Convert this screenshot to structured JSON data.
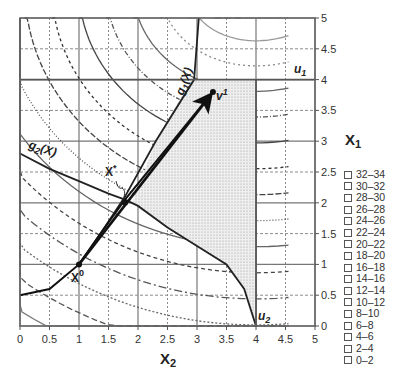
{
  "chart_data": {
    "type": "line",
    "title": "",
    "xlabel": "X2",
    "ylabel": "X1",
    "xlim": [
      0,
      5
    ],
    "ylim": [
      0,
      5
    ],
    "x_ticks": [
      "0",
      "0.5",
      "1",
      "1.5",
      "2",
      "2.5",
      "3",
      "3.5",
      "4",
      "4.5",
      "5"
    ],
    "y_ticks": [
      "0",
      "0.5",
      "1",
      "1.5",
      "2",
      "2.5",
      "3",
      "3.5",
      "4",
      "4.5",
      "5"
    ],
    "grid": true,
    "legend_position": "right",
    "legend_title": "X1",
    "legend": [
      "32–34",
      "30–32",
      "28–30",
      "26–28",
      "24–26",
      "22–24",
      "20–22",
      "18–20",
      "16–18",
      "14–16",
      "12–14",
      "10–12",
      "8–10",
      "6–8",
      "4–6",
      "2–4",
      "0–2"
    ],
    "constraints": [
      {
        "name": "g1(X)",
        "points": [
          [
            1.0,
            1.0
          ],
          [
            1.4,
            1.55
          ],
          [
            1.78,
            2.1
          ],
          [
            2.3,
            3.0
          ],
          [
            2.95,
            4.0
          ],
          [
            3.03,
            5.0
          ]
        ]
      },
      {
        "name": "g2(X)",
        "points": [
          [
            0.0,
            2.8
          ],
          [
            0.5,
            2.55
          ],
          [
            1.0,
            2.35
          ],
          [
            1.5,
            2.15
          ],
          [
            1.78,
            2.05
          ],
          [
            2.0,
            1.95
          ],
          [
            2.5,
            1.6
          ],
          [
            3.0,
            1.3
          ],
          [
            3.5,
            1.0
          ],
          [
            3.8,
            0.6
          ],
          [
            3.9,
            0.3
          ],
          [
            4.0,
            0.0
          ]
        ]
      },
      {
        "name": "u1",
        "points": [
          [
            0.0,
            4.0
          ],
          [
            5.0,
            4.0
          ]
        ]
      },
      {
        "name": "u2",
        "points": [
          [
            4.0,
            0.0
          ],
          [
            4.0,
            4.0
          ]
        ]
      }
    ],
    "feasible_region": [
      [
        2.9,
        4.0
      ],
      [
        4.0,
        4.0
      ],
      [
        4.0,
        0.0
      ],
      [
        3.9,
        0.3
      ],
      [
        3.8,
        0.6
      ],
      [
        3.5,
        1.0
      ],
      [
        3.0,
        1.3
      ],
      [
        2.5,
        1.6
      ],
      [
        2.0,
        1.95
      ],
      [
        1.9,
        2.0
      ],
      [
        2.3,
        3.0
      ]
    ],
    "points": [
      {
        "name": "X0",
        "x2": 1.0,
        "x1": 1.0
      },
      {
        "name": "X*",
        "x2": 1.78,
        "x1": 2.0
      },
      {
        "name": "v1",
        "x2": 3.27,
        "x1": 3.8
      }
    ],
    "search_path": [
      [
        0.0,
        0.5
      ],
      [
        0.5,
        0.6
      ],
      [
        1.0,
        1.0
      ],
      [
        1.4,
        1.55
      ],
      [
        1.78,
        2.05
      ],
      [
        3.27,
        3.8
      ]
    ],
    "arrow": {
      "from": [
        1.0,
        1.0
      ],
      "to": [
        3.27,
        3.8
      ]
    },
    "contour_levels": [
      2,
      4,
      6,
      8,
      10,
      12,
      14,
      16,
      18,
      20,
      22,
      24,
      26,
      28,
      30,
      32
    ]
  },
  "labels": {
    "x_axis": "X",
    "x_axis_sub": "2",
    "y_axis": "X",
    "y_axis_sub": "1",
    "g1": "g",
    "g1_sub": "1",
    "g1_arg": "(X)",
    "g2": "g",
    "g2_sub": "2",
    "g2_arg": "(X)",
    "u1": "u",
    "u1_sub": "1",
    "u2": "u",
    "u2_sub": "2",
    "x0": "X",
    "x0_sup": "0",
    "xstar": "X",
    "xstar_sup": "*",
    "v1": "v",
    "v1_sup": "1"
  }
}
